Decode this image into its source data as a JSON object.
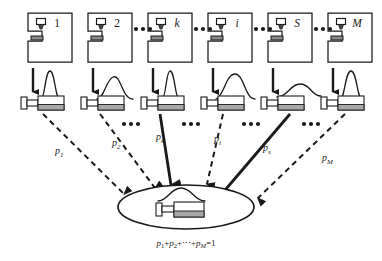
{
  "figure": {
    "background_color": "#ffffff",
    "ink_color": "#1a1a1a",
    "accent_gray": "#8a8a8a"
  },
  "stations": [
    {
      "id": "station-1",
      "label": "1",
      "label_style": "upright",
      "machine_x": 28,
      "distribution": "narrow-tall",
      "curve_width": 26,
      "curve_peak_height": 30,
      "flow_style": "dashed",
      "probability_label": "p",
      "probability_subscript": "1",
      "p_label_x": 55,
      "p_label_y": 152,
      "ellipsis_after": false
    },
    {
      "id": "station-2",
      "label": "2",
      "label_style": "upright",
      "machine_x": 88,
      "distribution": "wide-right-skew",
      "curve_width": 44,
      "curve_peak_height": 24,
      "flow_style": "dashed",
      "probability_label": "p",
      "probability_subscript": "2",
      "p_label_x": 113,
      "p_label_y": 146,
      "ellipsis_after": true
    },
    {
      "id": "station-k",
      "label": "k",
      "label_style": "italic",
      "machine_x": 148,
      "distribution": "narrow-tall",
      "curve_width": 24,
      "curve_peak_height": 30,
      "flow_style": "solid",
      "probability_label": "p",
      "probability_subscript": "k",
      "p_label_x": 158,
      "p_label_y": 140,
      "ellipsis_after": true
    },
    {
      "id": "station-i",
      "label": "i",
      "label_style": "italic",
      "machine_x": 208,
      "distribution": "wide-left-skew",
      "curve_width": 46,
      "curve_peak_height": 26,
      "flow_style": "dashed",
      "probability_label": "p",
      "probability_subscript": "i",
      "p_label_x": 213,
      "p_label_y": 140,
      "ellipsis_after": true
    },
    {
      "id": "station-S",
      "label": "S",
      "label_style": "italic",
      "machine_x": 268,
      "distribution": "very-wide-flat",
      "curve_width": 52,
      "curve_peak_height": 16,
      "flow_style": "solid",
      "probability_label": "p",
      "probability_subscript": "s",
      "p_label_x": 267,
      "p_label_y": 150,
      "ellipsis_after": true
    },
    {
      "id": "station-M",
      "label": "M",
      "label_style": "italic",
      "machine_x": 328,
      "distribution": "narrow-tall",
      "curve_width": 28,
      "curve_peak_height": 30,
      "flow_style": "dashed",
      "probability_label": "p",
      "probability_subscript": "M",
      "p_label_x": 327,
      "p_label_y": 158,
      "ellipsis_after": false
    }
  ],
  "top_ellipses": [
    {
      "name": "ellipsis-top-1",
      "x": 126,
      "y": 28
    },
    {
      "name": "ellipsis-top-2",
      "x": 186,
      "y": 28
    },
    {
      "name": "ellipsis-top-3",
      "x": 246,
      "y": 28
    },
    {
      "name": "ellipsis-top-4",
      "x": 306,
      "y": 28
    }
  ],
  "mid_ellipses": [
    {
      "name": "ellipsis-mid-1",
      "x": 128,
      "y": 123
    },
    {
      "name": "ellipsis-mid-2",
      "x": 188,
      "y": 123
    },
    {
      "name": "ellipsis-mid-3",
      "x": 248,
      "y": 123
    },
    {
      "name": "ellipsis-mid-4",
      "x": 308,
      "y": 123
    }
  ],
  "pool": {
    "name": "mixture-pool",
    "center_x": 186,
    "center_y": 207,
    "radius_x": 68,
    "radius_y": 22,
    "contains_curve": true,
    "contains_part": true
  },
  "equation": {
    "text": "p1+p2+⋯+pM=1",
    "terms": [
      {
        "base": "p",
        "sub": "1"
      },
      {
        "op": "+"
      },
      {
        "base": "p",
        "sub": "2"
      },
      {
        "op": "+"
      },
      {
        "op": "⋯"
      },
      {
        "op": "+"
      },
      {
        "base": "p",
        "sub": "M"
      },
      {
        "op": "="
      },
      {
        "value": "1"
      }
    ],
    "x": 186,
    "y": 244
  }
}
